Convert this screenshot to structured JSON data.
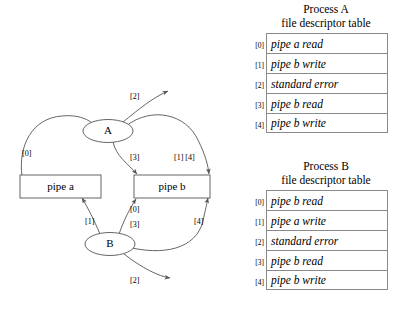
{
  "diagram": {
    "nodes": [
      {
        "id": "proc-a",
        "label": "A",
        "shape": "ellipse"
      },
      {
        "id": "proc-b",
        "label": "B",
        "shape": "ellipse"
      },
      {
        "id": "pipe-a",
        "label": "pipe a",
        "shape": "rect"
      },
      {
        "id": "pipe-b",
        "label": "pipe b",
        "shape": "rect"
      }
    ],
    "edge_labels": {
      "a_pipe_a_read": "[0]",
      "a_stderr": "[2]",
      "a_pipe_b_read": "[3]",
      "a_pipe_b_write": "[1] [4]",
      "b_pipe_a_write": "[1]",
      "b_pipe_b_read_0": "[0]",
      "b_pipe_b_read_3": "[3]",
      "b_pipe_b_write_4": "[4]",
      "b_stderr": "[2]"
    }
  },
  "tables": [
    {
      "id": "process-a",
      "title_line1": "Process A",
      "title_line2": "file descriptor table",
      "rows": [
        {
          "index": "[0]",
          "value": "pipe a read"
        },
        {
          "index": "[1]",
          "value": "pipe b write"
        },
        {
          "index": "[2]",
          "value": "standard error"
        },
        {
          "index": "[3]",
          "value": "pipe b read"
        },
        {
          "index": "[4]",
          "value": "pipe b write"
        }
      ]
    },
    {
      "id": "process-b",
      "title_line1": "Process B",
      "title_line2": "file descriptor table",
      "rows": [
        {
          "index": "[0]",
          "value": "pipe b read"
        },
        {
          "index": "[1]",
          "value": "pipe a write"
        },
        {
          "index": "[2]",
          "value": "standard error"
        },
        {
          "index": "[3]",
          "value": "pipe b read"
        },
        {
          "index": "[4]",
          "value": "pipe b write"
        }
      ]
    }
  ],
  "colors": {
    "stroke": "#555555",
    "table_border": "#8a8a8a",
    "text": "#000000"
  }
}
